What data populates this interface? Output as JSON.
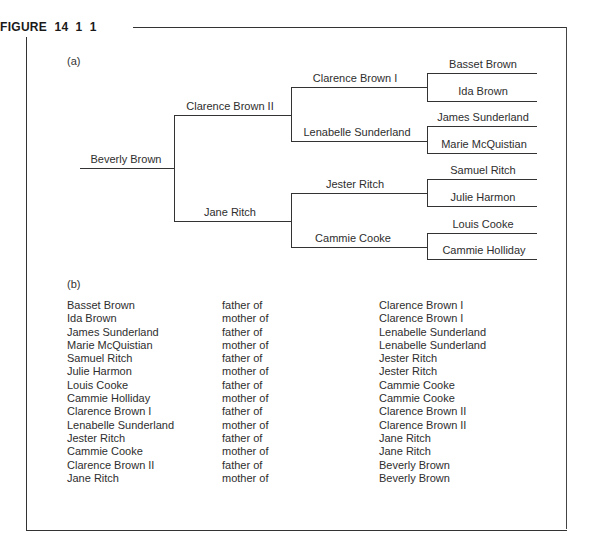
{
  "figure": {
    "title": "FIGURE  14  1  1",
    "part_a_label": "(a)",
    "part_b_label": "(b)"
  },
  "tree": {
    "root": "Beverly Brown",
    "parents": [
      "Clarence Brown II",
      "Jane Ritch"
    ],
    "grandparents": [
      "Clarence Brown I",
      "Lenabelle Sunderland",
      "Jester Ritch",
      "Cammie Cooke"
    ],
    "great_grandparents": [
      "Basset Brown",
      "Ida Brown",
      "James Sunderland",
      "Marie McQuistian",
      "Samuel Ritch",
      "Julie Harmon",
      "Louis Cooke",
      "Cammie Holliday"
    ]
  },
  "relations": [
    {
      "person": "Basset Brown",
      "relation": "father of",
      "child": "Clarence Brown I"
    },
    {
      "person": "Ida Brown",
      "relation": "mother of",
      "child": "Clarence Brown I"
    },
    {
      "person": "James Sunderland",
      "relation": "father of",
      "child": "Lenabelle Sunderland"
    },
    {
      "person": "Marie McQuistian",
      "relation": "mother of",
      "child": "Lenabelle Sunderland"
    },
    {
      "person": "Samuel Ritch",
      "relation": "father of",
      "child": "Jester Ritch"
    },
    {
      "person": "Julie Harmon",
      "relation": "mother of",
      "child": "Jester Ritch"
    },
    {
      "person": "Louis Cooke",
      "relation": "father of",
      "child": "Cammie Cooke"
    },
    {
      "person": "Cammie Holliday",
      "relation": "mother of",
      "child": "Cammie Cooke"
    },
    {
      "person": "Clarence Brown I",
      "relation": "father of",
      "child": "Clarence Brown II"
    },
    {
      "person": "Lenabelle Sunderland",
      "relation": "mother of",
      "child": "Clarence Brown II"
    },
    {
      "person": "Jester Ritch",
      "relation": "father of",
      "child": "Jane Ritch"
    },
    {
      "person": "Cammie Cooke",
      "relation": "mother of",
      "child": "Jane Ritch"
    },
    {
      "person": "Clarence Brown II",
      "relation": "father of",
      "child": "Beverly Brown"
    },
    {
      "person": "Jane Ritch",
      "relation": "mother of",
      "child": "Beverly Brown"
    }
  ]
}
